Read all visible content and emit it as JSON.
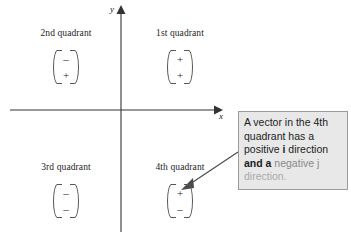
{
  "diagram": {
    "axes": {
      "x_label": "x",
      "y_label": "y"
    },
    "quadrants": [
      {
        "id": "q2",
        "label": "2nd quadrant",
        "i": "–",
        "j": "+"
      },
      {
        "id": "q1",
        "label": "1st quadrant",
        "i": "+",
        "j": "+"
      },
      {
        "id": "q3",
        "label": "3rd quadrant",
        "i": "–",
        "j": "–"
      },
      {
        "id": "q4",
        "label": "4th quadrant",
        "i": "+",
        "j": "–"
      }
    ],
    "callout": {
      "line1": "A vector in the 4th",
      "line2": "quadrant has a",
      "line3_pre": "positive ",
      "line3_bold": "i",
      "line3_post": " direction",
      "line4_bold": "and a",
      "line4_fade": " negative j",
      "line5_fade": "direction."
    },
    "colors": {
      "axis": "#333333",
      "text": "#1d1d1d",
      "callout_bg": "#e8e8e8",
      "callout_border": "#9a9a9a",
      "callout_fade": "#8a8a8a",
      "arrow": "#4a4a4a"
    }
  }
}
